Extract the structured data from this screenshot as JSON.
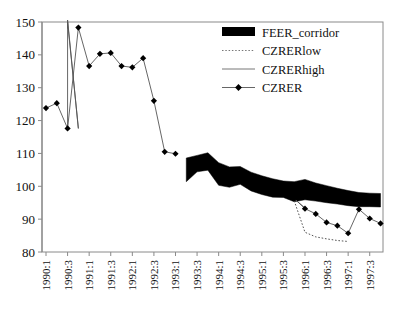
{
  "chart_data": {
    "type": "line",
    "title": "",
    "xlabel": "",
    "ylabel": "",
    "ylim": [
      80,
      150
    ],
    "yticks": [
      80,
      90,
      100,
      110,
      120,
      130,
      140,
      150
    ],
    "grid": false,
    "legend_position": "top-right",
    "x": [
      "1990:1",
      "1990:2",
      "1990:3",
      "1990:4",
      "1991:1",
      "1991:2",
      "1991:3",
      "1991:4",
      "1992:1",
      "1992:2",
      "1992:3",
      "1992:4",
      "1993:1",
      "1993:2",
      "1993:3",
      "1993:4",
      "1994:1",
      "1994:2",
      "1994:3",
      "1994:4",
      "1995:1",
      "1995:2",
      "1995:3",
      "1995:4",
      "1996:1",
      "1996:2",
      "1996:3",
      "1996:4",
      "1997:1",
      "1997:2",
      "1997:3",
      "1997:4"
    ],
    "xtick_labels": [
      "1990:1",
      "1990:3",
      "1991:1",
      "1991:3",
      "1992:1",
      "1992:3",
      "1993:1",
      "1993:3",
      "1994:1",
      "1994:3",
      "1995:1",
      "1995:3",
      "1996:1",
      "1996:3",
      "1997:1",
      "1997:3"
    ],
    "series": [
      {
        "name": "FEER_corridor",
        "type": "band",
        "color": "#000000",
        "start_index": 13,
        "upper": [
          null,
          null,
          null,
          null,
          null,
          null,
          null,
          null,
          null,
          null,
          null,
          null,
          null,
          108.6,
          109.4,
          110.2,
          107.2,
          105.9,
          106.0,
          104.3,
          103.2,
          102.3,
          101.6,
          101.4,
          102.1,
          101.0,
          100.2,
          99.4,
          98.7,
          98.1,
          97.9,
          97.8
        ],
        "lower": [
          null,
          null,
          null,
          null,
          null,
          null,
          null,
          null,
          null,
          null,
          null,
          null,
          null,
          101.4,
          104.4,
          104.9,
          100.3,
          99.7,
          100.6,
          98.6,
          97.5,
          96.7,
          96.6,
          95.3,
          95.9,
          95.5,
          95.0,
          94.6,
          94.1,
          93.8,
          93.8,
          93.7
        ]
      },
      {
        "name": "CZRERlow",
        "type": "dotted-line",
        "color": "#555555",
        "values": [
          null,
          null,
          null,
          null,
          null,
          null,
          null,
          null,
          null,
          null,
          null,
          null,
          null,
          null,
          null,
          null,
          null,
          null,
          null,
          null,
          null,
          null,
          null,
          95.6,
          86.0,
          84.6,
          84.0,
          83.5,
          83.2,
          null,
          null,
          null
        ]
      },
      {
        "name": "CZRERhigh",
        "type": "solid-line",
        "color": "#555555",
        "values": [
          null,
          null,
          180.0,
          117.6,
          null,
          null,
          null,
          null,
          null,
          null,
          null,
          null,
          null,
          null,
          null,
          null,
          null,
          null,
          null,
          null,
          null,
          null,
          null,
          96.2,
          null,
          null,
          null,
          null,
          null,
          null,
          null,
          null
        ]
      },
      {
        "name": "CZRER",
        "type": "marker-line",
        "color": "#000000",
        "marker": "diamond",
        "values": [
          123.8,
          125.3,
          117.6,
          148.3,
          136.6,
          140.3,
          140.6,
          136.6,
          136.2,
          139.0,
          126.0,
          110.5,
          109.9,
          null,
          null,
          null,
          null,
          null,
          null,
          null,
          null,
          null,
          null,
          96.3,
          93.2,
          91.6,
          89.0,
          88.0,
          85.7,
          93.0,
          90.2,
          88.7
        ]
      }
    ]
  },
  "legend": {
    "items": [
      {
        "label": "FEER_corridor",
        "swatch": "filled-rect",
        "color": "#000000"
      },
      {
        "label": "CZRERlow",
        "swatch": "dotted-line",
        "color": "#777777"
      },
      {
        "label": "CZRERhigh",
        "swatch": "solid-line",
        "color": "#777777"
      },
      {
        "label": "CZRER",
        "swatch": "diamond-line",
        "color": "#000000"
      }
    ]
  },
  "axes": {
    "y_labels": [
      "150",
      "140",
      "130",
      "120",
      "110",
      "100",
      "90",
      "80"
    ],
    "x_labels": [
      "1990:1",
      "1990:3",
      "1991:1",
      "1991:3",
      "1992:1",
      "1992:3",
      "1993:1",
      "1993:3",
      "1994:1",
      "1994:3",
      "1995:1",
      "1995:3",
      "1996:1",
      "1996:3",
      "1997:1",
      "1997:3"
    ]
  }
}
